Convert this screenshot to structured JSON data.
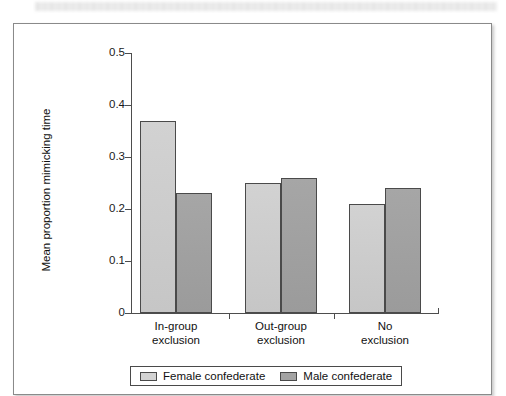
{
  "figure": {
    "redacted_caption_strip": "",
    "legend": {
      "items": [
        {
          "label": "Female confederate",
          "color": "#d2d2d2",
          "icon": "legend-swatch"
        },
        {
          "label": "Male confederate",
          "color": "#a3a3a3",
          "icon": "legend-swatch"
        }
      ]
    }
  },
  "chart_data": {
    "type": "bar",
    "title": "",
    "xlabel": "",
    "ylabel": "Mean proportion mimicking time",
    "ylim": [
      0,
      0.5
    ],
    "yticks": [
      "0",
      "0.1",
      "0.2",
      "0.3",
      "0.4",
      "0.5"
    ],
    "ytick_values": [
      0,
      0.1,
      0.2,
      0.3,
      0.4,
      0.5
    ],
    "grid": false,
    "legend_position": "bottom",
    "categories": [
      "In-group exclusion",
      "Out-group exclusion",
      "No exclusion"
    ],
    "category_lines": [
      [
        "In-group",
        "exclusion"
      ],
      [
        "Out-group",
        "exclusion"
      ],
      [
        "No",
        "exclusion"
      ]
    ],
    "series": [
      {
        "name": "Female confederate",
        "color": "#d2d2d2",
        "values": [
          0.37,
          0.25,
          0.21
        ]
      },
      {
        "name": "Male confederate",
        "color": "#a3a3a3",
        "values": [
          0.23,
          0.26,
          0.24
        ]
      }
    ]
  }
}
